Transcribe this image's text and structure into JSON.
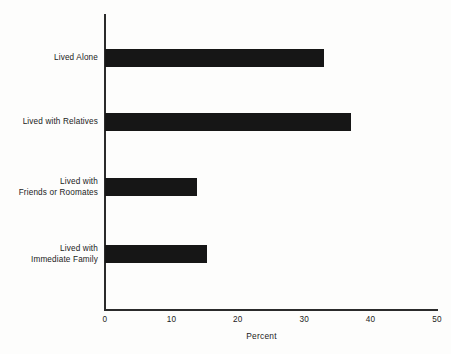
{
  "chart_data": {
    "type": "bar",
    "orientation": "horizontal",
    "title": "",
    "xlabel": "Percent",
    "ylabel": "",
    "categories": [
      "Lived Alone",
      "Lived with Relatives",
      "Lived with\nFriends or Roomates",
      "Lived with\nImmediate Family"
    ],
    "values": [
      33.0,
      37.1,
      13.8,
      15.3
    ],
    "xlim": [
      0,
      50
    ],
    "xticks": [
      0,
      10,
      20,
      30,
      40,
      50
    ],
    "xtick_labels": [
      "0",
      "10",
      "20",
      "30",
      "40",
      "50"
    ],
    "grid": false,
    "legend": null,
    "bar_color": "#161616",
    "axis_color": "#2b2b2b",
    "background_color": "#fdfdfc"
  }
}
